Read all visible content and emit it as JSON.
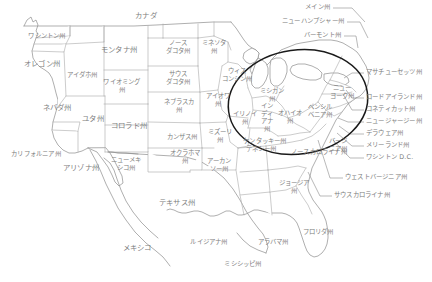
{
  "map": {
    "title": "United States state map with Japanese labels",
    "colors": {
      "background": "#ffffff",
      "border": "#a9a9a9",
      "coast": "#8c8c8c",
      "label_text": "#7d7d7d",
      "highlight": "#1a1a1a",
      "leader": "#8a8a8a"
    },
    "highlight_region": {
      "name": "great-lakes-northeast-ellipse",
      "cx": 298,
      "cy": 102,
      "rx": 70,
      "ry": 52,
      "rotation": -8
    },
    "countries": [
      {
        "name": "canada",
        "label": "カナダ",
        "x": 146,
        "y": 16,
        "size": "big"
      },
      {
        "name": "mexico",
        "label": "メキシコ",
        "x": 137,
        "y": 248,
        "size": "big"
      }
    ],
    "states": [
      {
        "name": "washington",
        "label": "ワシントン州",
        "x": 47,
        "y": 37
      },
      {
        "name": "oregon",
        "label": "オレゴン州",
        "x": 42,
        "y": 64,
        "size": "big"
      },
      {
        "name": "california",
        "label": "カリフォルニア州",
        "x": 36,
        "y": 155
      },
      {
        "name": "nevada",
        "label": "ネバダ州",
        "x": 57,
        "y": 108,
        "size": "big"
      },
      {
        "name": "idaho",
        "label": "アイダホ州",
        "x": 82,
        "y": 76
      },
      {
        "name": "montana",
        "label": "モンタナ州",
        "x": 119,
        "y": 50,
        "size": "big"
      },
      {
        "name": "wyoming",
        "label": "ワイオミング\n州",
        "x": 122,
        "y": 87
      },
      {
        "name": "utah",
        "label": "ユタ州",
        "x": 93,
        "y": 119,
        "size": "big"
      },
      {
        "name": "colorado",
        "label": "コロラド州",
        "x": 129,
        "y": 126,
        "size": "big"
      },
      {
        "name": "arizona",
        "label": "アリゾナ州",
        "x": 81,
        "y": 168,
        "size": "big"
      },
      {
        "name": "new-mexico",
        "label": "ニューメキ\nシコ州",
        "x": 126,
        "y": 165
      },
      {
        "name": "north-dakota",
        "label": "ノース\nダコタ州",
        "x": 178,
        "y": 48
      },
      {
        "name": "south-dakota",
        "label": "サウス\nダコタ州",
        "x": 178,
        "y": 79
      },
      {
        "name": "nebraska",
        "label": "ネブラスカ\n州",
        "x": 179,
        "y": 107
      },
      {
        "name": "kansas",
        "label": "カンザス州",
        "x": 182,
        "y": 138
      },
      {
        "name": "oklahoma",
        "label": "オクラホマ\n州",
        "x": 185,
        "y": 158
      },
      {
        "name": "texas",
        "label": "テキサス州",
        "x": 177,
        "y": 203,
        "size": "big"
      },
      {
        "name": "minnesota",
        "label": "ミネソタ\n州",
        "x": 214,
        "y": 48
      },
      {
        "name": "wisconsin",
        "label": "ウィス\nコンシン州",
        "x": 237,
        "y": 76
      },
      {
        "name": "iowa",
        "label": "アイオワ\n州",
        "x": 218,
        "y": 101
      },
      {
        "name": "missouri",
        "label": "ミズーリ\n州",
        "x": 220,
        "y": 137
      },
      {
        "name": "illinois",
        "label": "イリノイ\n州",
        "x": 245,
        "y": 119
      },
      {
        "name": "arkansas",
        "label": "アーカン\nソー州",
        "x": 219,
        "y": 166
      },
      {
        "name": "louisiana",
        "label": "ルイジアナ州",
        "x": 209,
        "y": 243
      },
      {
        "name": "mississippi",
        "label": "ミシシッピ州",
        "x": 243,
        "y": 265
      },
      {
        "name": "alabama",
        "label": "アラバマ州",
        "x": 273,
        "y": 243
      },
      {
        "name": "tennessee",
        "label": "テネシー州",
        "x": 261,
        "y": 150
      },
      {
        "name": "kentucky",
        "label": "ケンタッキー州",
        "x": 265,
        "y": 142
      },
      {
        "name": "michigan",
        "label": "ミシガン\n州",
        "x": 272,
        "y": 96
      },
      {
        "name": "indiana",
        "label": "イン\nディ\nアナ\n州",
        "x": 267,
        "y": 118
      },
      {
        "name": "ohio",
        "label": "オハイオ\n州",
        "x": 290,
        "y": 118
      },
      {
        "name": "pennsylvania",
        "label": "ペンシル\nベニア州",
        "x": 320,
        "y": 112
      },
      {
        "name": "new-york",
        "label": "ニュー\nヨーク州",
        "x": 342,
        "y": 93
      },
      {
        "name": "virginia",
        "label": "バージ\nニア州",
        "x": 338,
        "y": 146
      },
      {
        "name": "north-carolina",
        "label": "ノースカロライナ州",
        "x": 319,
        "y": 153
      },
      {
        "name": "georgia",
        "label": "ジョージア\n州",
        "x": 294,
        "y": 188
      },
      {
        "name": "florida",
        "label": "フロリダ州",
        "x": 318,
        "y": 233
      }
    ],
    "callouts_top": [
      {
        "name": "maine",
        "label": "メイン州",
        "text_x": 330,
        "text_y": 8,
        "line": "M333,8 L352,8 L365,22"
      },
      {
        "name": "new-hampshire",
        "label": "ニューハンプシャー州",
        "text_x": 344,
        "text_y": 22,
        "line": "M347,22 L360,22 L368,38"
      },
      {
        "name": "vermont",
        "label": "バーモント州",
        "text_x": 341,
        "text_y": 36,
        "line": "M344,36 L356,36 L358,48"
      }
    ],
    "callouts_right": [
      {
        "name": "massachusetts",
        "label": "マサチューセッツ州",
        "text_x": 366,
        "text_y": 73,
        "line": "M364,73 L352,73 L344,78"
      },
      {
        "name": "rhode-island",
        "label": "ロードアイランド州",
        "text_x": 366,
        "text_y": 98,
        "line": "M364,98 L352,98 L346,90"
      },
      {
        "name": "connecticut",
        "label": "コネティカット州",
        "text_x": 366,
        "text_y": 110,
        "line": "M364,110 L352,110 L343,94"
      },
      {
        "name": "new-jersey",
        "label": "ニュージャージー州",
        "text_x": 366,
        "text_y": 122,
        "line": "M364,122 L348,122 L338,118"
      },
      {
        "name": "delaware",
        "label": "デラウェア州",
        "text_x": 366,
        "text_y": 134,
        "line": "M364,134 L350,134 L339,126"
      },
      {
        "name": "maryland",
        "label": "メリーランド州",
        "text_x": 366,
        "text_y": 146,
        "line": "M364,146 L352,146 L337,133"
      },
      {
        "name": "washington-dc",
        "label": "ワシントン D.C.",
        "text_x": 366,
        "text_y": 158,
        "line": "M364,158 L350,158 L333,140"
      },
      {
        "name": "west-virginia",
        "label": "ウェストバージニア州",
        "text_x": 345,
        "text_y": 178,
        "line": "M343,178 L330,178 L318,140"
      },
      {
        "name": "south-carolina",
        "label": "サウスカロライナ州",
        "text_x": 334,
        "text_y": 196,
        "line": "M332,196 L320,196 L308,172"
      }
    ]
  }
}
